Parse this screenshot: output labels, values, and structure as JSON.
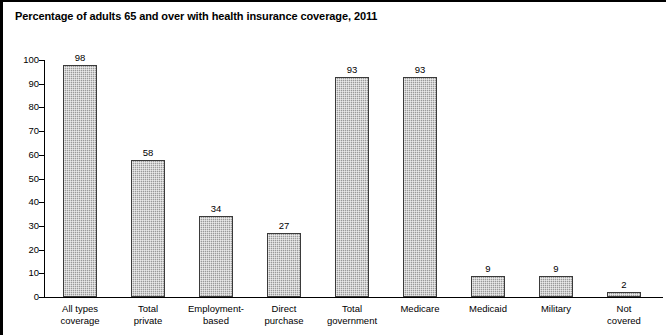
{
  "chart_data": {
    "type": "bar",
    "title": "Percentage of adults 65 and over with health insurance coverage, 2011",
    "xlabel": "",
    "ylabel": "",
    "ylim": [
      0,
      100
    ],
    "ytick_labels": [
      "100",
      "90",
      "80",
      "70",
      "60",
      "50",
      "40",
      "30",
      "20",
      "10",
      "0"
    ],
    "yticks": [
      100,
      90,
      80,
      70,
      60,
      50,
      40,
      30,
      20,
      10,
      0
    ],
    "grid": false,
    "legend": "none",
    "categories": [
      "All types coverage",
      "Total private",
      "Employment-based",
      "Direct purchase",
      "Total government",
      "Medicare",
      "Medicaid",
      "Military",
      "Not covered"
    ],
    "category_lines": [
      [
        "All types",
        "coverage"
      ],
      [
        "Total",
        "private"
      ],
      [
        "Employment-",
        "based"
      ],
      [
        "Direct",
        "purchase"
      ],
      [
        "Total",
        "government"
      ],
      [
        "Medicare",
        ""
      ],
      [
        "Medicaid",
        ""
      ],
      [
        "Military",
        ""
      ],
      [
        "Not",
        "covered"
      ]
    ],
    "values": [
      98,
      58,
      34,
      27,
      93,
      93,
      9,
      9,
      2
    ],
    "value_labels": [
      "98",
      "58",
      "34",
      "27",
      "93",
      "93",
      "9",
      "9",
      "2"
    ],
    "colors": {
      "bar_fill": "#9a9a9a",
      "bar_border": "#3a3a3a",
      "axis": "#000000",
      "text": "#000000",
      "background": "#ffffff",
      "frame_border": "#000000"
    }
  }
}
